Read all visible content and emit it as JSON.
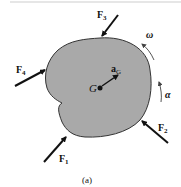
{
  "diagram": {
    "caption": "(a)",
    "body_fill": "#a9a9a9",
    "center_label": "G",
    "forces": [
      {
        "name": "F",
        "sub": "1"
      },
      {
        "name": "F",
        "sub": "2"
      },
      {
        "name": "F",
        "sub": "3"
      },
      {
        "name": "F",
        "sub": "4"
      }
    ],
    "acceleration": {
      "name": "a",
      "sub": "G"
    },
    "angular_velocity": "ω",
    "angular_acceleration": "α"
  }
}
